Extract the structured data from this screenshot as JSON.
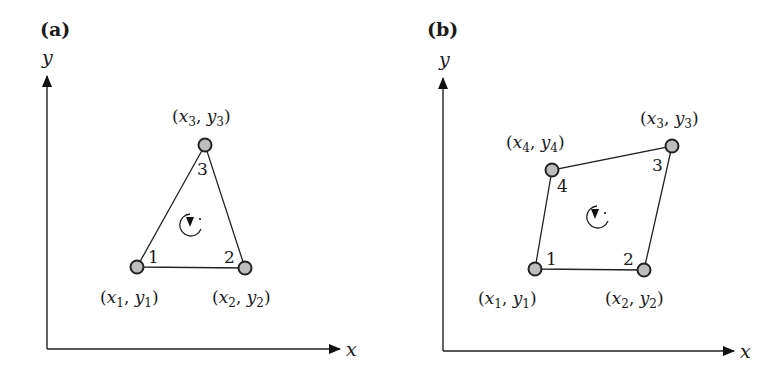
{
  "panels": [
    {
      "label": "(a)",
      "x_axis_label": "x",
      "y_axis_label": "y",
      "element_type": "triangle",
      "rotation_direction": "counterclockwise",
      "nodes": [
        {
          "number": "1",
          "var_x": "x",
          "var_y": "y",
          "sub": "1"
        },
        {
          "number": "2",
          "var_x": "x",
          "var_y": "y",
          "sub": "2"
        },
        {
          "number": "3",
          "var_x": "x",
          "var_y": "y",
          "sub": "3"
        }
      ]
    },
    {
      "label": "(b)",
      "x_axis_label": "x",
      "y_axis_label": "y",
      "element_type": "quadrilateral",
      "rotation_direction": "counterclockwise",
      "nodes": [
        {
          "number": "1",
          "var_x": "x",
          "var_y": "y",
          "sub": "1"
        },
        {
          "number": "2",
          "var_x": "x",
          "var_y": "y",
          "sub": "2"
        },
        {
          "number": "3",
          "var_x": "x",
          "var_y": "y",
          "sub": "3"
        },
        {
          "number": "4",
          "var_x": "x",
          "var_y": "y",
          "sub": "4"
        }
      ]
    }
  ]
}
